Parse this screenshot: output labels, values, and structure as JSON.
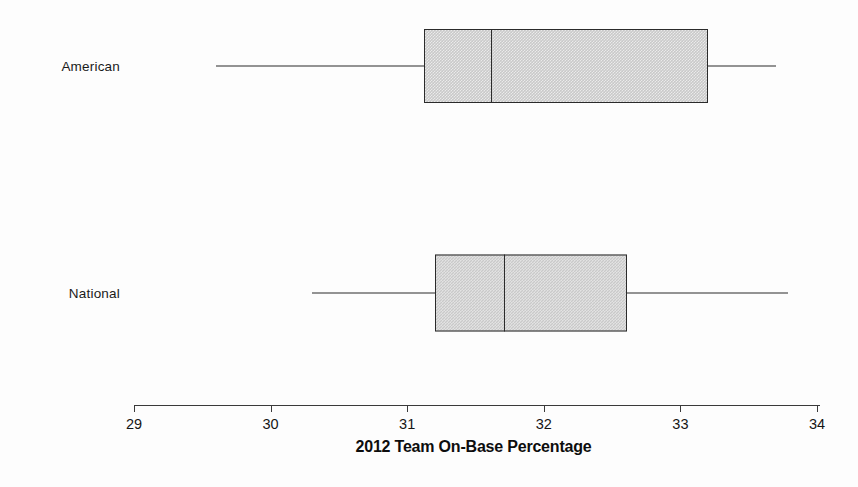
{
  "figure": {
    "width": 858,
    "height": 487,
    "background_color": "#fdfdfd",
    "line_color": "#2b2b2b",
    "box_fill_color": "#c9c9c9"
  },
  "chart_data": {
    "type": "box",
    "title": "",
    "xlabel": "2012 Team On-Base Percentage",
    "ylabel": "",
    "orientation": "horizontal",
    "grid": false,
    "legend": false,
    "xlim": [
      29,
      34
    ],
    "xticks": [
      29,
      30,
      31,
      32,
      33,
      34
    ],
    "xticklabels": [
      "29",
      "30",
      "31",
      "32",
      "33",
      "34"
    ],
    "categories": [
      "American",
      "National"
    ],
    "boxes": [
      {
        "label": "American",
        "whisker_low": 29.6,
        "q1": 31.12,
        "median": 31.61,
        "q3": 33.2,
        "whisker_high": 33.7,
        "outliers": []
      },
      {
        "label": "National",
        "whisker_low": 30.3,
        "q1": 31.2,
        "median": 31.71,
        "q3": 32.61,
        "whisker_high": 33.79,
        "outliers": []
      }
    ]
  },
  "axis": {
    "title": "2012 Team On-Base Percentage",
    "tick_labels": [
      "29",
      "30",
      "31",
      "32",
      "33",
      "34"
    ]
  },
  "labels": {
    "american": "American",
    "national": "National"
  }
}
